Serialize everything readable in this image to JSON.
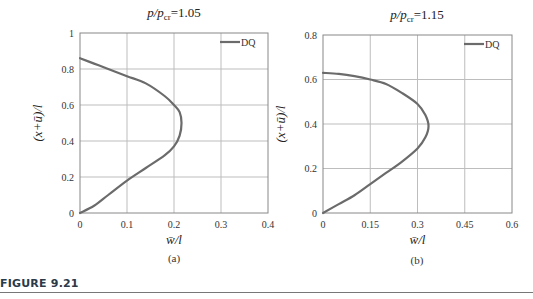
{
  "figure": {
    "caption": "FIGURE 9.21",
    "curve_color": "#6b6b6b",
    "grid_color": "#bdbdbd",
    "frame_color": "#888888"
  },
  "chart_data": [
    {
      "type": "line",
      "panel_label": "(a)",
      "title": "p/p_cr=1.05",
      "title_parts": {
        "p": "p",
        "slash": "/",
        "pcr": "p",
        "sub": "cr",
        "value": "=1.05"
      },
      "xlabel": "w̄/l",
      "ylabel": "(x+ū)/l",
      "xlim": [
        0,
        0.4
      ],
      "ylim": [
        0,
        1
      ],
      "xticks": [
        "0",
        "0.1",
        "0.2",
        "0.3",
        "0.4"
      ],
      "yticks": [
        "0",
        "0.2",
        "0.4",
        "0.6",
        "0.8",
        "1"
      ],
      "grid": true,
      "legend": {
        "position": "upper right",
        "entries": [
          "DQ"
        ]
      },
      "series": [
        {
          "name": "DQ",
          "x": [
            0,
            0.03,
            0.06,
            0.1,
            0.14,
            0.18,
            0.2,
            0.212,
            0.216,
            0.212,
            0.2,
            0.18,
            0.14,
            0.1,
            0.06,
            0.03,
            0
          ],
          "y": [
            0,
            0.04,
            0.1,
            0.18,
            0.25,
            0.32,
            0.37,
            0.43,
            0.5,
            0.56,
            0.6,
            0.65,
            0.72,
            0.76,
            0.8,
            0.83,
            0.86
          ]
        }
      ]
    },
    {
      "type": "line",
      "panel_label": "(b)",
      "title": "p/p_cr=1.15",
      "title_parts": {
        "p": "p",
        "slash": "/",
        "pcr": "p",
        "sub": "cr",
        "value": "=1.15"
      },
      "xlabel": "w̄/l",
      "ylabel": "(x+ū)/l",
      "xlim": [
        0,
        0.6
      ],
      "ylim": [
        0,
        0.8
      ],
      "xticks": [
        "0",
        "0.15",
        "0.3",
        "0.45",
        "0.6"
      ],
      "yticks": [
        "0",
        "0.2",
        "0.4",
        "0.6",
        "0.8"
      ],
      "grid": true,
      "legend": {
        "position": "upper right",
        "entries": [
          "DQ"
        ]
      },
      "series": [
        {
          "name": "DQ",
          "x": [
            0,
            0.05,
            0.1,
            0.15,
            0.2,
            0.25,
            0.3,
            0.325,
            0.335,
            0.325,
            0.3,
            0.25,
            0.2,
            0.15,
            0.1,
            0.05,
            0
          ],
          "y": [
            0,
            0.04,
            0.08,
            0.13,
            0.18,
            0.23,
            0.29,
            0.34,
            0.39,
            0.44,
            0.49,
            0.54,
            0.58,
            0.6,
            0.615,
            0.625,
            0.63
          ]
        }
      ]
    }
  ]
}
